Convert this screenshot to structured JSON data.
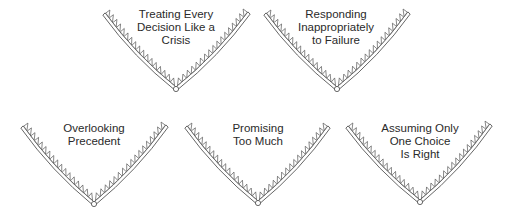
{
  "diagram": {
    "stroke_color": "#555555",
    "fill_color": "#ffffff",
    "shapes": [
      {
        "id": "crisis",
        "lines": [
          "Treating Every",
          "Decision Like a",
          "Crisis"
        ],
        "left": [
          104,
          14
        ],
        "vertex": [
          176,
          89
        ],
        "right": [
          249,
          13
        ],
        "label_center_x": 176,
        "label_top": 8
      },
      {
        "id": "failure",
        "lines": [
          "Responding",
          "Inappropriately",
          "to Failure"
        ],
        "left": [
          265,
          14
        ],
        "vertex": [
          337,
          89
        ],
        "right": [
          409,
          13
        ],
        "label_center_x": 336,
        "label_top": 8
      },
      {
        "id": "precedent",
        "lines": [
          "Overlooking",
          "Precedent"
        ],
        "left": [
          22,
          127
        ],
        "vertex": [
          94,
          204
        ],
        "right": [
          167,
          126
        ],
        "label_center_x": 94,
        "label_top": 122
      },
      {
        "id": "promising",
        "lines": [
          "Promising",
          "Too Much"
        ],
        "left": [
          186,
          127
        ],
        "vertex": [
          258,
          203
        ],
        "right": [
          329,
          127
        ],
        "label_center_x": 258,
        "label_top": 122
      },
      {
        "id": "one-choice",
        "lines": [
          "Assuming Only",
          "One Choice",
          "Is Right"
        ],
        "left": [
          347,
          127
        ],
        "vertex": [
          420,
          202
        ],
        "right": [
          491,
          125
        ],
        "label_center_x": 420,
        "label_top": 122
      }
    ]
  }
}
